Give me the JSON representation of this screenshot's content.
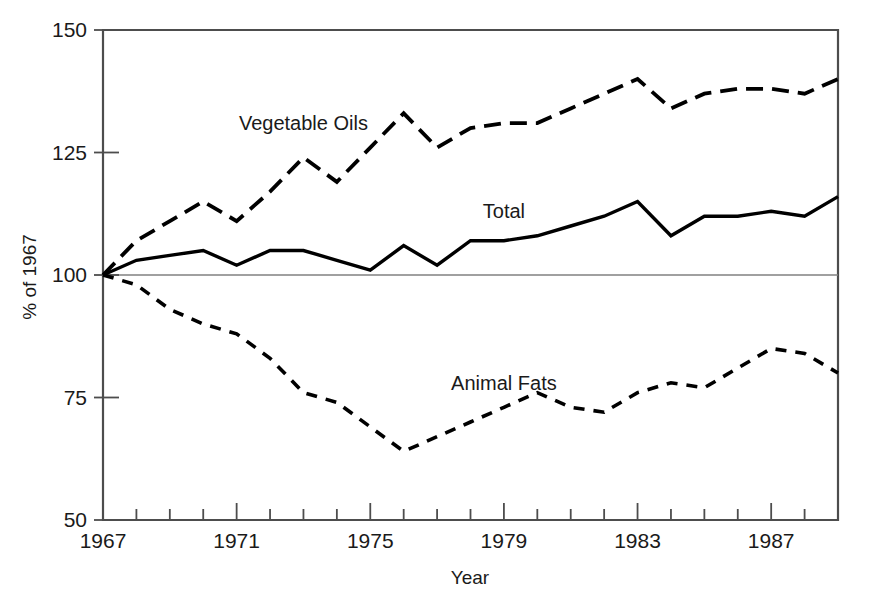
{
  "chart_data": {
    "type": "line",
    "title": "",
    "subtitle": "",
    "xlabel": "Year",
    "ylabel": "% of 1967",
    "xlim": [
      1967,
      1989
    ],
    "ylim": [
      50,
      150
    ],
    "grid": false,
    "reference_line": 100,
    "legend_position": "inline-annotations",
    "x": [
      1967,
      1968,
      1969,
      1970,
      1971,
      1972,
      1973,
      1974,
      1975,
      1976,
      1977,
      1978,
      1979,
      1980,
      1981,
      1982,
      1983,
      1984,
      1985,
      1986,
      1987,
      1988,
      1989
    ],
    "y_ticks": [
      50,
      75,
      100,
      125,
      150
    ],
    "y_tick_labels": [
      "50",
      "75",
      "100",
      "125",
      "150"
    ],
    "x_ticks": [
      1967,
      1968,
      1969,
      1970,
      1971,
      1972,
      1973,
      1974,
      1975,
      1976,
      1977,
      1978,
      1979,
      1980,
      1981,
      1982,
      1983,
      1984,
      1985,
      1986,
      1987,
      1988,
      1989
    ],
    "x_tick_labels": [
      "1967",
      "",
      "",
      "",
      "1971",
      "",
      "",
      "",
      "1975",
      "",
      "",
      "",
      "1979",
      "",
      "",
      "",
      "1983",
      "",
      "",
      "",
      "1987",
      "",
      ""
    ],
    "series": [
      {
        "name": "Vegetable Oils",
        "style": "long-dash",
        "label_x": 1973,
        "label_y": 131,
        "values": [
          100,
          107,
          111,
          115,
          111,
          117,
          124,
          119,
          126,
          133,
          126,
          130,
          131,
          131,
          134,
          137,
          140,
          134,
          137,
          138,
          138,
          137,
          140
        ]
      },
      {
        "name": "Total",
        "style": "solid",
        "label_x": 1979,
        "label_y": 113,
        "values": [
          100,
          103,
          104,
          105,
          102,
          105,
          105,
          103,
          101,
          106,
          102,
          107,
          107,
          108,
          110,
          112,
          115,
          108,
          112,
          112,
          113,
          112,
          116
        ]
      },
      {
        "name": "Animal Fats",
        "style": "short-dash",
        "label_x": 1979,
        "label_y": 78,
        "values": [
          100,
          98,
          93,
          90,
          88,
          83,
          76,
          74,
          69,
          64,
          67,
          70,
          73,
          76,
          73,
          72,
          76,
          78,
          77,
          81,
          85,
          84,
          80
        ]
      }
    ]
  }
}
